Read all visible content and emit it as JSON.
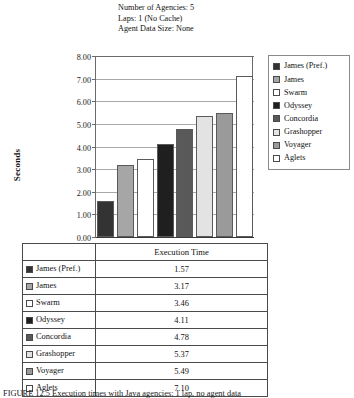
{
  "figure": {
    "title_lines": [
      "Number of Agencies: 5",
      "Laps: 1 (No Cache)",
      "Agent Data Size: None"
    ],
    "caption": "FIGURE 12.5   Execution times with Java agencies: 1 lap, no agent data"
  },
  "chart_data": {
    "type": "bar",
    "xlabel": "",
    "ylabel": "Seconds",
    "ylim": [
      0,
      8
    ],
    "ytick_step": 1,
    "ytick_labels": [
      "0.00",
      "1.00",
      "2.00",
      "3.00",
      "4.00",
      "5.00",
      "6.00",
      "7.00",
      "8.00"
    ],
    "grid": true,
    "legend_position": "right",
    "categories": [
      "James (Pref.)",
      "James",
      "Swarm",
      "Odyssey",
      "Concordia",
      "Grashopper",
      "Voyager",
      "Aglets"
    ],
    "values": [
      1.57,
      3.17,
      3.46,
      4.11,
      4.78,
      5.37,
      5.49,
      7.1
    ],
    "series_name": "Execution Time",
    "colors": [
      "#333333",
      "#a6a6a6",
      "#ffffff",
      "#1f1f1f",
      "#595959",
      "#e3e3e3",
      "#9a9a9a",
      "#ffffff"
    ]
  },
  "legend": {
    "items": [
      {
        "label": "James (Pref.)",
        "color": "#333333"
      },
      {
        "label": "James",
        "color": "#a6a6a6"
      },
      {
        "label": "Swarm",
        "color": "#ffffff"
      },
      {
        "label": "Odyssey",
        "color": "#1f1f1f"
      },
      {
        "label": "Concordia",
        "color": "#595959"
      },
      {
        "label": "Grashopper",
        "color": "#e3e3e3"
      },
      {
        "label": "Voyager",
        "color": "#9a9a9a"
      },
      {
        "label": "Aglets",
        "color": "#ffffff"
      }
    ]
  },
  "table": {
    "header": {
      "label": "",
      "value": "Execution Time"
    },
    "rows": [
      {
        "label": "James (Pref.)",
        "value": "1.57",
        "color": "#333333"
      },
      {
        "label": "James",
        "value": "3.17",
        "color": "#a6a6a6"
      },
      {
        "label": "Swarm",
        "value": "3.46",
        "color": "#ffffff"
      },
      {
        "label": "Odyssey",
        "value": "4.11",
        "color": "#1f1f1f"
      },
      {
        "label": "Concordia",
        "value": "4.78",
        "color": "#595959"
      },
      {
        "label": "Grashopper",
        "value": "5.37",
        "color": "#e3e3e3"
      },
      {
        "label": "Voyager",
        "value": "5.49",
        "color": "#9a9a9a"
      },
      {
        "label": "Aglets",
        "value": "7.10",
        "color": "#ffffff"
      }
    ]
  }
}
